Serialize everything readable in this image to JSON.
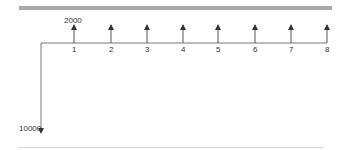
{
  "diagram": {
    "initial_outflow": {
      "label": "10000",
      "period": 0,
      "direction": "down"
    },
    "inflow_label": "2000",
    "periods": [
      {
        "label": "1",
        "x": 74,
        "amount": 2000
      },
      {
        "label": "2",
        "x": 111,
        "amount": 2000
      },
      {
        "label": "3",
        "x": 147,
        "amount": 2000
      },
      {
        "label": "4",
        "x": 183,
        "amount": 2000
      },
      {
        "label": "5",
        "x": 218,
        "amount": 2000
      },
      {
        "label": "6",
        "x": 255,
        "amount": 2000
      },
      {
        "label": "7",
        "x": 291,
        "amount": 2000
      },
      {
        "label": "8",
        "x": 327,
        "amount": 2000
      }
    ],
    "colors": {
      "line": "#555555",
      "bar": "#a9a9a9"
    }
  }
}
